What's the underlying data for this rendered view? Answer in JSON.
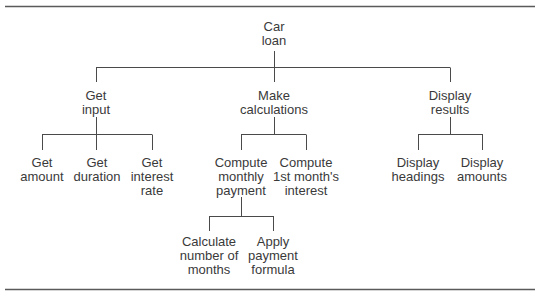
{
  "diagram": {
    "type": "hierarchy chart",
    "root": {
      "id": "car-loan",
      "lines": [
        "Car",
        "loan"
      ],
      "children": [
        {
          "id": "get-input",
          "lines": [
            "Get",
            "input"
          ],
          "children": [
            {
              "id": "get-amount",
              "lines": [
                "Get",
                "amount"
              ]
            },
            {
              "id": "get-duration",
              "lines": [
                "Get",
                "duration"
              ]
            },
            {
              "id": "get-interest-rate",
              "lines": [
                "Get",
                "interest",
                "rate"
              ]
            }
          ]
        },
        {
          "id": "make-calculations",
          "lines": [
            "Make",
            "calculations"
          ],
          "children": [
            {
              "id": "compute-monthly-payment",
              "lines": [
                "Compute",
                "monthly",
                "payment"
              ],
              "children": [
                {
                  "id": "calculate-number-of-months",
                  "lines": [
                    "Calculate",
                    "number of",
                    "months"
                  ]
                },
                {
                  "id": "apply-payment-formula",
                  "lines": [
                    "Apply",
                    "payment",
                    "formula"
                  ]
                }
              ]
            },
            {
              "id": "compute-first-month-interest",
              "lines": [
                "Compute",
                "1st month's",
                "interest"
              ]
            }
          ]
        },
        {
          "id": "display-results",
          "lines": [
            "Display",
            "results"
          ],
          "children": [
            {
              "id": "display-headings",
              "lines": [
                "Display",
                "headings"
              ]
            },
            {
              "id": "display-amounts",
              "lines": [
                "Display",
                "amounts"
              ]
            }
          ]
        }
      ]
    },
    "colors": {
      "line": "#4a4a4a",
      "text": "#3a3a3a",
      "rule": "#5a5a5a"
    }
  }
}
